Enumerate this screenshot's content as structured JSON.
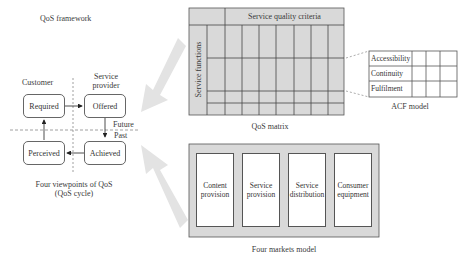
{
  "framework": {
    "title": "QoS framework",
    "cycle": {
      "customer_label": "Customer",
      "provider_label": "Service provider",
      "provider_label_line1": "Service",
      "provider_label_line2": "provider",
      "future_label": "Future",
      "past_label": "Past",
      "nodes": {
        "required": "Required",
        "offered": "Offered",
        "achieved": "Achieved",
        "perceived": "Perceived"
      },
      "caption_line1": "Four viewpoints of QoS",
      "caption_line2": "(QoS cycle)"
    }
  },
  "matrix": {
    "header": "Service quality criteria",
    "row_header": "Service functions",
    "caption": "QoS matrix",
    "colors": {
      "fill": "#d9d9d9",
      "line": "#555555"
    }
  },
  "acf": {
    "rows": [
      "Accessibility",
      "Continuity",
      "Fulfilment"
    ],
    "caption": "ACF model"
  },
  "markets": {
    "items": [
      {
        "line1": "Content",
        "line2": "provision"
      },
      {
        "line1": "Service",
        "line2": "provision"
      },
      {
        "line1": "Service",
        "line2": "distribution"
      },
      {
        "line1": "Consumer",
        "line2": "equipment"
      }
    ],
    "caption": "Four markets model",
    "colors": {
      "fill": "#d9d9d9"
    }
  },
  "arrows": {
    "color": "#e3e3e3"
  }
}
